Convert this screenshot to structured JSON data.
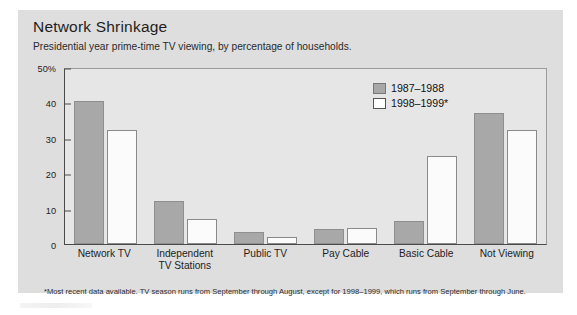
{
  "card": {
    "title": "Network Shrinkage",
    "subtitle": "Presidential year prime-time TV viewing, by percentage of households.",
    "footnote": "*Most recent data available. TV season runs from September through August, except for 1998–1999, which runs from September through June."
  },
  "legend": {
    "series": [
      {
        "label": "1987–1988",
        "color": "#a8a8a8"
      },
      {
        "label": "1998–1999*",
        "color": "#ffffff"
      }
    ]
  },
  "axis": {
    "yticks": [
      "50%",
      "40",
      "30",
      "20",
      "10",
      "0"
    ]
  },
  "chart_data": {
    "type": "bar",
    "title": "Network Shrinkage",
    "subtitle": "Presidential year prime-time TV viewing, by percentage of households.",
    "xlabel": "",
    "ylabel": "",
    "ylim": [
      0,
      50
    ],
    "yticks": [
      0,
      10,
      20,
      30,
      40,
      50
    ],
    "grid": false,
    "legend_position": "top-right",
    "categories": [
      "Network TV",
      "Independent TV Stations",
      "Public TV",
      "Pay Cable",
      "Basic Cable",
      "Not Viewing"
    ],
    "series": [
      {
        "name": "1987–1988",
        "color": "#a8a8a8",
        "values": [
          40.3,
          12.2,
          3.5,
          4.3,
          6.5,
          37.0
        ]
      },
      {
        "name": "1998–1999*",
        "color": "#ffffff",
        "values": [
          32.3,
          7.0,
          2.0,
          4.6,
          25.0,
          32.3
        ]
      }
    ],
    "annotations": [
      "*Most recent data available. TV season runs from September through August, except for 1998–1999, which runs from September through June."
    ]
  }
}
